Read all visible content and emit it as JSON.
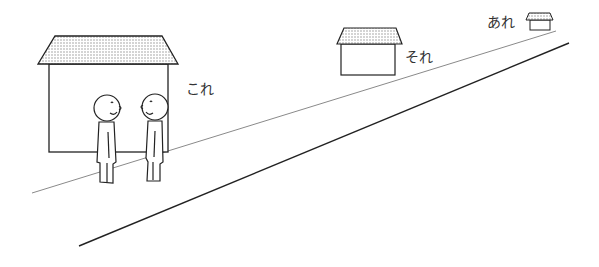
{
  "illustration": {
    "description": "Line drawing illustrating Japanese demonstratives by distance",
    "labels": {
      "near": "これ",
      "middle": "それ",
      "far": "あれ"
    },
    "houses": [
      {
        "id": "near-house",
        "label": "これ"
      },
      {
        "id": "middle-house",
        "label": "それ"
      },
      {
        "id": "far-house",
        "label": "あれ"
      }
    ],
    "people": [
      {
        "id": "person-left"
      },
      {
        "id": "person-right"
      }
    ],
    "colors": {
      "line": "#222222",
      "road_edge_light": "#888888",
      "roof_dots": "#888888",
      "background": "#ffffff"
    }
  }
}
